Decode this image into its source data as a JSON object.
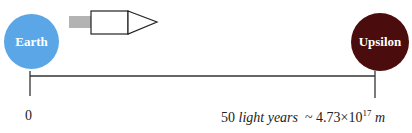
{
  "diagram": {
    "origin": {
      "label": "Earth",
      "color": "#5aa6e6"
    },
    "destination": {
      "label": "Upsilon",
      "color": "#4a0c0c"
    },
    "rocket": {
      "body_color": "#ffffff",
      "exhaust_color": "#b3b3b3",
      "direction": "right"
    },
    "scale": {
      "start_label": "0",
      "end_value": "50",
      "end_unit": "light years",
      "approx_symbol": "~",
      "meters_mantissa": "4.73",
      "times_symbol": "×",
      "meters_base": "10",
      "meters_exponent": "17",
      "meters_unit": "m"
    }
  }
}
